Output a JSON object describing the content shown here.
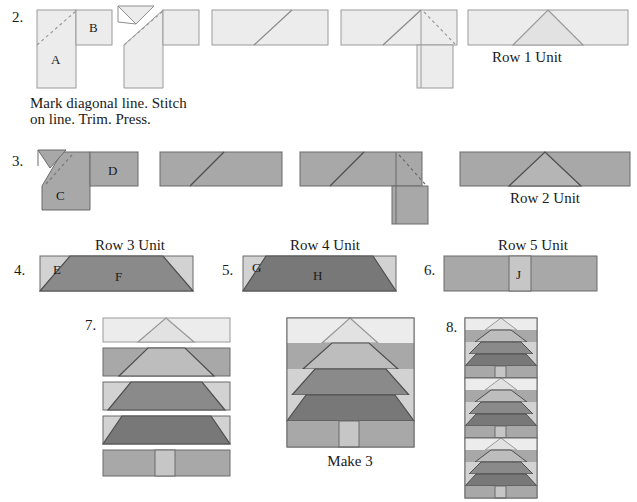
{
  "document": {
    "type": "quilt-piecing-instruction-diagram",
    "title": "Tree Block Piecing Steps"
  },
  "colors": {
    "background": "#ffffff",
    "light": "#ececec",
    "light_mid": "#d2d2d2",
    "medium": "#a8a8a8",
    "dark": "#8a8a8a",
    "darker": "#787878",
    "outline": "#6b6b6b",
    "outline_light": "#9a9a9a",
    "dashed": "#9a9a9a",
    "text": "#1a1a1a"
  },
  "steps": [
    {
      "number": "2.",
      "pieces": [
        "A",
        "B"
      ],
      "instruction_line1": "Mark diagonal line. Stitch",
      "instruction_line2": "on line. Trim. Press.",
      "result_caption": "Row 1 Unit"
    },
    {
      "number": "3.",
      "pieces": [
        "C",
        "D"
      ],
      "result_caption": "Row 2 Unit"
    },
    {
      "number": "4.",
      "pieces": [
        "E",
        "F"
      ],
      "caption": "Row 3 Unit"
    },
    {
      "number": "5.",
      "pieces": [
        "G",
        "H"
      ],
      "caption": "Row 4 Unit"
    },
    {
      "number": "6.",
      "pieces": [
        "J"
      ],
      "caption": "Row 5 Unit"
    },
    {
      "number": "7.",
      "caption": ""
    },
    {
      "number": "8.",
      "caption": ""
    }
  ],
  "labels": {
    "step2_num": "2.",
    "step3_num": "3.",
    "step4_num": "4.",
    "step5_num": "5.",
    "step6_num": "6.",
    "step7_num": "7.",
    "step8_num": "8.",
    "piece_a": "A",
    "piece_b": "B",
    "piece_c": "C",
    "piece_d": "D",
    "piece_e": "E",
    "piece_f": "F",
    "piece_g": "G",
    "piece_h": "H",
    "piece_j": "J",
    "row1_unit": "Row 1 Unit",
    "row2_unit": "Row 2 Unit",
    "row3_unit": "Row 3 Unit",
    "row4_unit": "Row 4 Unit",
    "row5_unit": "Row 5 Unit",
    "instruction_line1": "Mark diagonal line. Stitch",
    "instruction_line2": "on line. Trim. Press.",
    "make3": "Make 3"
  }
}
